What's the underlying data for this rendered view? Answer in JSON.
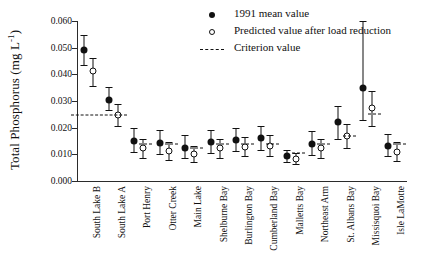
{
  "chart_data": {
    "type": "scatter",
    "title": "",
    "xlabel": "",
    "ylabel": "Total Phosphorus (mg L-1)",
    "ylabel_main": "Total Phosphorus (mg L",
    "ylabel_sup": "-1",
    "ylabel_tail": ")",
    "ylim": [
      0.0,
      0.06
    ],
    "ytick_labels": [
      "0.060",
      "0.050",
      "0.040",
      "0.030",
      "0.020",
      "0.010",
      "0.000"
    ],
    "ytick_values": [
      0.06,
      0.05,
      0.04,
      0.03,
      0.02,
      0.01,
      0.0
    ],
    "grid": false,
    "legend_position": "top-right",
    "categories": [
      "South Lake B",
      "South Lake A",
      "Port Henry",
      "Otter Creek",
      "Main Lake",
      "Shelburne Bay",
      "Burlington Bay",
      "Cumberland Bay",
      "Malletts Bay",
      "Northeast Arm",
      "St. Albans Bay",
      "Missisquoi Bay",
      "Isle LaMotte"
    ],
    "series": [
      {
        "name": "1991 mean value",
        "marker": "filled-circle",
        "values": [
          0.049,
          0.0305,
          0.015,
          0.0142,
          0.0125,
          0.0145,
          0.0152,
          0.0162,
          0.0092,
          0.0138,
          0.0222,
          0.035,
          0.0132
        ],
        "err_low": [
          0.0435,
          0.0265,
          0.0108,
          0.0103,
          0.0088,
          0.0105,
          0.0112,
          0.0118,
          0.0072,
          0.0098,
          0.0158,
          0.0228,
          0.0092
        ],
        "err_high": [
          0.0548,
          0.0352,
          0.0198,
          0.0192,
          0.0172,
          0.0192,
          0.0198,
          0.0208,
          0.0118,
          0.0188,
          0.0282,
          0.06,
          0.0175
        ]
      },
      {
        "name": "Predicted value after load reduction",
        "marker": "open-circle",
        "values": [
          0.0412,
          0.0248,
          0.0122,
          0.0112,
          0.01,
          0.0122,
          0.0128,
          0.0132,
          0.0082,
          0.0122,
          0.0168,
          0.0272,
          0.0108
        ],
        "err_low": [
          0.0358,
          0.0208,
          0.0088,
          0.0078,
          0.0072,
          0.0085,
          0.0092,
          0.0095,
          0.0062,
          0.0085,
          0.0122,
          0.0205,
          0.0075
        ],
        "err_high": [
          0.0462,
          0.0288,
          0.0158,
          0.0148,
          0.0132,
          0.0158,
          0.0165,
          0.0172,
          0.0105,
          0.0158,
          0.0215,
          0.0338,
          0.0145
        ]
      }
    ],
    "criterion": {
      "name": "Criterion value",
      "style": "dashed",
      "values": [
        null,
        0.0248,
        0.014,
        0.014,
        0.0125,
        0.014,
        0.014,
        0.014,
        0.0105,
        0.014,
        0.0168,
        0.025,
        0.014
      ],
      "long_segment_index": 1
    },
    "legend": [
      {
        "symbol": "filled-circle",
        "label": "1991 mean value"
      },
      {
        "symbol": "open-circle",
        "label": "Predicted value after load reduction"
      },
      {
        "symbol": "dashed-line",
        "label": "Criterion value"
      }
    ]
  }
}
